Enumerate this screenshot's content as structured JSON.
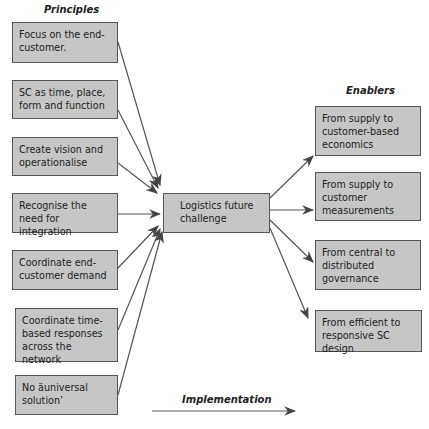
{
  "headings": {
    "principles": "Principles",
    "enablers": "Enablers",
    "implementation": "Implementation"
  },
  "principles": [
    {
      "label": "Focus on the end-customer."
    },
    {
      "label": "SC as time, place, form and function"
    },
    {
      "label": "Create vision and operationalise"
    },
    {
      "label": "Recognise the need for integration"
    },
    {
      "label": "Coordinate end-customer demand"
    },
    {
      "label": "Coordinate time-based responses across the network"
    },
    {
      "label": "No äuniversal solution’"
    }
  ],
  "center": {
    "label": "Logistics future challenge"
  },
  "enablers": [
    {
      "label": "From supply to customer-based economics"
    },
    {
      "label": "From supply to customer measurements"
    },
    {
      "label": "From central to distributed governance"
    },
    {
      "label": "From efficient to responsive SC design"
    }
  ]
}
